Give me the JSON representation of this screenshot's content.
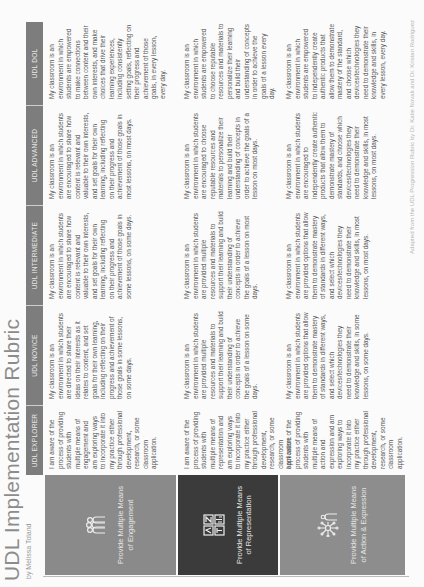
{
  "document": {
    "title": "UDL Implementation Rubric",
    "author": "by Melissa Toland",
    "footer": "Adapted from the UDL Progression Rubric by Dr. Katie Novak and Dr. Kristan Rodriguez"
  },
  "levels": [
    {
      "label": "UDL EXPLORER"
    },
    {
      "label": "UDL NOVICE"
    },
    {
      "label": "UDL INTERMEDIATE"
    },
    {
      "label": "UDL ADVANCED"
    },
    {
      "label": "UDL DOL"
    }
  ],
  "rows": [
    {
      "label": "Provide Multiple Means of Engagement",
      "icon": "people-icon",
      "color": "#8a8a8a",
      "cells": [
        "I am aware of the process of providing students with multiple means of engagement and am exploring ways to incorporate it into my practice either through professional development, research, or some classroom application.",
        "My classroom is an environment in which students are directed to share their ideas on their interests as it relates to content, and set goals for their own learning, including reflecting on their progress and achievement of those goals in some lessons, on some days.",
        "My classroom is an environment in which students are encouraged to share how content is relevant and valuable to their own interests, and set goals for their own learning, including reflecting on their progress and achievement of those goals in some lessons, on some days.",
        "My classroom is an environment in which students are encouraged to share how content is relevant and valuable to their own interests, and set goals for their own learning, including reflecting on their progress and achievement of those goals in most lessons, on most days.",
        "My classroom is an environment in which students are empowered to make connections between content and their own interests, and make choices that drive their learning experiences, including consistently setting goals, reflecting on their progress and achievement of those goals, in every lesson, every day."
      ]
    },
    {
      "label": "Provide Multiple Means of Representation",
      "icon": "media-grid-icon",
      "color": "#3b3b3b",
      "cells": [
        "I am aware of the process of providing students with multiple means of representation and am exploring ways to incorporate it into my practice either through professional development, research, or some classroom application.",
        "My classroom is an environment in which students are provided multiple resources and materials to support their learning and build their understanding of concepts in order to achieve the goals of a lesson on some days.",
        "My classroom is an environment in which students are provided multiple resources and materials to support their learning and build their understanding of concepts in order to achieve the goals of a lesson on most days.",
        "My classroom is an environment in which students are encouraged to choose reputable resources and materials to personalize their learning and build their understanding of concepts in order to achieve the goals of a lesson on most days.",
        "My classroom is an environment in which students are empowered to choose reputable resources and materials to personalize their learning and build their understanding of concepts in order to achieve the goals of a lesson every day."
      ]
    },
    {
      "label": "Provide Multiple Means of Action & Expression",
      "icon": "network-person-icon",
      "color": "#8d8d8d",
      "cells": [
        "I am aware of the process of providing students with multiple means of action and expression and am exploring ways to incorporate it into my practice either through professional development, research, or some classroom application.",
        "My classroom is an environment in which students are provided options that allow them to demonstrate mastery of standards in different ways, and select which devices/technologies they need to demonstrate their knowledge and skills, in some lessons, on some days.",
        "My classroom is an environment in which students are provided options that allow them to demonstrate mastery of standards in different ways, and select which devices/technologies they need to demonstrate their knowledge and skills, in most lessons, on most days.",
        "My classroom is an environment in which students are encouraged to independently create authentic products that allow them to demonstrate mastery of standards, and choose which devices/technologies they need to demonstrate their knowledge and skills, in most lessons, on most days.",
        "My classroom is an environment in which students are empowered to independently create authentic products that allow them to demonstrate mastery of the standard, and choose which devices/technologies they need to demonstrate their knowledge and skills, in every lesson, every day."
      ]
    }
  ]
}
